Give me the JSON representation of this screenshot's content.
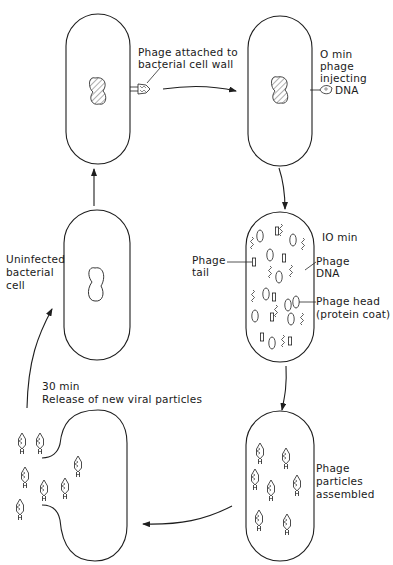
{
  "diagram": {
    "stages": [
      {
        "id": "attached",
        "label_lines": [
          "Phage attached to",
          "bacterial cell wall"
        ]
      },
      {
        "id": "injecting",
        "label_lines": [
          "O min",
          "phage",
          "injecting",
          "DNA"
        ]
      },
      {
        "id": "replicating",
        "time_label": "IO min",
        "callouts": {
          "tail": [
            "Phage",
            "tail"
          ],
          "dna": [
            "Phage",
            "DNA"
          ],
          "head": [
            "Phage head",
            "(protein coat)"
          ]
        }
      },
      {
        "id": "assembled",
        "label_lines": [
          "Phage",
          "particles",
          "assembled"
        ]
      },
      {
        "id": "release",
        "label_lines": [
          "30 min",
          "Release of new viral particles"
        ]
      },
      {
        "id": "uninfected",
        "label_lines": [
          "Uninfected",
          "bacterial",
          "cell"
        ]
      }
    ],
    "colors": {
      "line": "#1e1e1e",
      "background": "#ffffff"
    }
  }
}
